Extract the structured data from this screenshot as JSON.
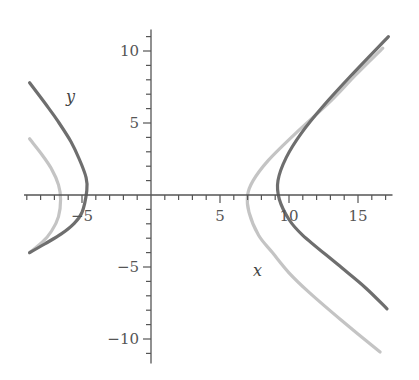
{
  "chart_data": {
    "type": "line",
    "title": "",
    "xlabel": "x",
    "ylabel": "y",
    "xlim": [
      -9.2,
      17.5
    ],
    "ylim": [
      -11.7,
      11.5
    ],
    "grid": false,
    "legend": null,
    "x_ticks": [
      -5,
      5,
      10,
      15
    ],
    "y_ticks": [
      10,
      5,
      -5,
      -10
    ],
    "x_tick_labels": [
      "−5",
      "5",
      "10",
      "15"
    ],
    "y_tick_labels": [
      "10",
      "5",
      "−5",
      "−10"
    ],
    "minor_tick_step": 1,
    "series": [
      {
        "name": "original hyperbola (right branch)",
        "color": "#6e6e6e",
        "points": [
          [
            17.2,
            11.0
          ],
          [
            14.5,
            8.3
          ],
          [
            12.5,
            6.2
          ],
          [
            10.9,
            4.3
          ],
          [
            9.8,
            2.6
          ],
          [
            9.2,
            1.0
          ],
          [
            9.3,
            -0.3
          ],
          [
            10.0,
            -1.7
          ],
          [
            11.0,
            -2.8
          ],
          [
            13.5,
            -4.8
          ],
          [
            15.5,
            -6.4
          ],
          [
            17.1,
            -7.9
          ]
        ]
      },
      {
        "name": "original hyperbola (left branch)",
        "color": "#6e6e6e",
        "points": [
          [
            -8.8,
            7.8
          ],
          [
            -7.7,
            6.4
          ],
          [
            -6.8,
            5.2
          ],
          [
            -5.8,
            3.7
          ],
          [
            -5.2,
            2.5
          ],
          [
            -4.7,
            1.2
          ],
          [
            -4.65,
            0.3
          ],
          [
            -5.0,
            -1.2
          ],
          [
            -5.6,
            -2.0
          ],
          [
            -6.5,
            -2.7
          ],
          [
            -7.7,
            -3.4
          ],
          [
            -8.8,
            -4.0
          ]
        ]
      },
      {
        "name": "transformed hyperbola (right branch)",
        "color": "#c4c4c4",
        "points": [
          [
            16.8,
            10.2
          ],
          [
            14.8,
            8.3
          ],
          [
            13.0,
            6.5
          ],
          [
            10.5,
            4.3
          ],
          [
            8.5,
            2.4
          ],
          [
            7.4,
            1.0
          ],
          [
            7.0,
            0.0
          ],
          [
            7.1,
            -1.2
          ],
          [
            7.8,
            -2.8
          ],
          [
            8.8,
            -4.0
          ],
          [
            10.0,
            -5.4
          ],
          [
            11.5,
            -6.8
          ],
          [
            13.8,
            -8.7
          ],
          [
            16.6,
            -10.9
          ]
        ]
      },
      {
        "name": "transformed hyperbola (left branch)",
        "color": "#c4c4c4",
        "points": [
          [
            -8.8,
            3.9
          ],
          [
            -7.9,
            2.8
          ],
          [
            -7.2,
            1.8
          ],
          [
            -6.7,
            0.7
          ],
          [
            -6.55,
            -0.3
          ],
          [
            -6.7,
            -1.5
          ],
          [
            -7.2,
            -2.5
          ],
          [
            -7.9,
            -3.3
          ],
          [
            -8.8,
            -4.0
          ]
        ]
      }
    ]
  },
  "labels": {
    "x_axis_name": "x",
    "y_axis_name": "y"
  }
}
